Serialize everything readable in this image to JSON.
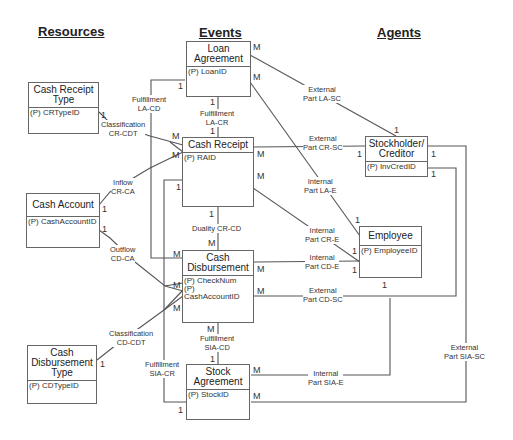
{
  "headings": {
    "resources": "Resources",
    "events": "Events",
    "agents": "Agents"
  },
  "entities": {
    "loan_agreement": {
      "name": "Loan Agreement",
      "attrs": [
        "(P) LoanID"
      ]
    },
    "cash_receipt": {
      "name": "Cash Receipt",
      "attrs": [
        "(P) RAID"
      ]
    },
    "cash_disbursement": {
      "name": "Cash Disbursement",
      "attrs": [
        "(P) CheckNum",
        "(P) CashAccountID"
      ]
    },
    "stock_agreement": {
      "name": "Stock Agreement",
      "attrs": [
        "(P) StockID"
      ]
    },
    "cash_receipt_type": {
      "name": "Cash Receipt Type",
      "attrs": [
        "(P) CRTypeID"
      ]
    },
    "cash_account": {
      "name": "Cash Account",
      "attrs": [
        "(P) CashAccountID"
      ]
    },
    "cash_disbursement_type": {
      "name": "Cash Disbursement Type",
      "attrs": [
        "(P) CDTypeID"
      ]
    },
    "stockholder_creditor": {
      "name": "Stockholder/ Creditor",
      "attrs": [
        "(P) InvCredID"
      ]
    },
    "employee": {
      "name": "Employee",
      "attrs": [
        "(P) EmployeeID"
      ]
    }
  },
  "relationships": {
    "fulfillment_la_cd": {
      "line1": "Fulfillment",
      "line2": "LA-CD"
    },
    "fulfillment_la_cr": {
      "line1": "Fulfillment",
      "line2": "LA-CR"
    },
    "classification_cr_cdt": {
      "line1": "Classification",
      "line2": "CR-CDT"
    },
    "inflow_cr_ca": {
      "line1": "Inflow",
      "line2": "CR-CA"
    },
    "outflow_cd_ca": {
      "line1": "Outflow",
      "line2": "CD-CA"
    },
    "duality_cr_cd": {
      "line1": "Duality CR-CD",
      "line2": ""
    },
    "classification_cd_cdt": {
      "line1": "Classification",
      "line2": "CD-CDT"
    },
    "fulfillment_sia_cd": {
      "line1": "Fulfillment",
      "line2": "SIA-CD"
    },
    "fulfillment_sia_cr": {
      "line1": "Fulfillment",
      "line2": "SIA-CR"
    },
    "external_la_sc": {
      "line1": "External",
      "line2": "Part LA-SC"
    },
    "external_cr_sc": {
      "line1": "External",
      "line2": "Part CR-SC"
    },
    "internal_la_e": {
      "line1": "Internal",
      "line2": "Part LA-E"
    },
    "internal_cr_e": {
      "line1": "Internal",
      "line2": "Part CR-E"
    },
    "internal_cd_e": {
      "line1": "Internal",
      "line2": "Part CD-E"
    },
    "external_cd_sc": {
      "line1": "External",
      "line2": "Part CD-SC"
    },
    "internal_sia_e": {
      "line1": "Internal",
      "line2": "Part SIA-E"
    },
    "external_sia_sc": {
      "line1": "External",
      "line2": "Part SIA-SC"
    }
  },
  "cardinalities": {
    "one": "1",
    "many": "M"
  },
  "colors": {
    "line": "#555555",
    "border": "#666666",
    "text": "#333333",
    "background": "#ffffff"
  }
}
